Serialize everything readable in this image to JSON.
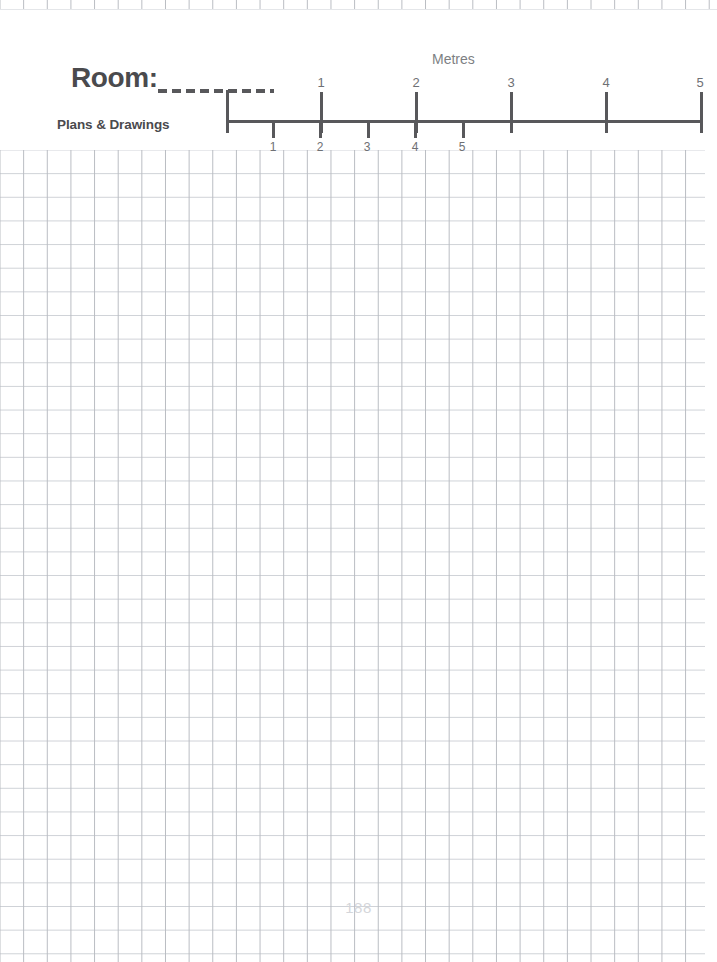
{
  "page": {
    "title": "Room:",
    "subtitle": "Plans & Drawings",
    "page_number": "188",
    "paper": "graph-paper",
    "colors": {
      "ink": "#58585b",
      "muted_text": "#6e7074",
      "grid_vertical": "#b9bcc2",
      "grid_horizontal": "#cfd2d7",
      "page_number": "#d4d6da",
      "background": "#ffffff"
    }
  },
  "scale_bar": {
    "unit_label": "Metres",
    "upper_scale": {
      "note": "coarse scale - 1 metre per major division",
      "labels": [
        "1",
        "2",
        "3",
        "4",
        "5"
      ],
      "x_positions": [
        320,
        415,
        510,
        605,
        700
      ]
    },
    "lower_scale": {
      "note": "fine scale - 1 metre per minor division",
      "labels": [
        "1",
        "2",
        "3",
        "4",
        "5"
      ],
      "x_positions": [
        273,
        320,
        367,
        415,
        462
      ]
    },
    "origin_x": 226,
    "rail_end_x": 701
  },
  "grid": {
    "cell_size_px": 23.65,
    "top_px": 150,
    "left_px": 0,
    "width_px": 705,
    "height_px": 812
  }
}
